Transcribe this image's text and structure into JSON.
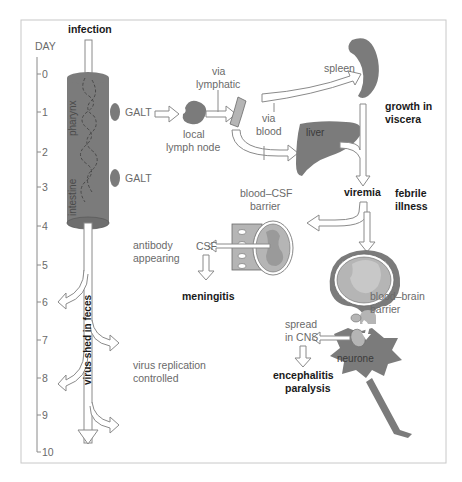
{
  "diagram": {
    "title": "infection",
    "day_axis": {
      "label": "DAY",
      "ticks": [
        "0",
        "1",
        "2",
        "3",
        "4",
        "5",
        "6",
        "7",
        "8",
        "9",
        "10"
      ]
    },
    "gut": {
      "upper_label": "pharynx",
      "lower_label": "intestine",
      "galt_upper": "GALT",
      "galt_lower": "GALT",
      "shed_label": "virus shed in feces"
    },
    "lymph": {
      "node_label_1": "local",
      "node_label_2": "lymph node",
      "via_lymphatic_1": "via",
      "via_lymphatic_2": "lymphatic",
      "via_blood_1": "via",
      "via_blood_2": "blood"
    },
    "viscera": {
      "spleen": "spleen",
      "liver": "liver",
      "growth_1": "growth in",
      "growth_2": "viscera"
    },
    "viremia": {
      "label": "viremia",
      "febrile_1": "febrile",
      "febrile_2": "illness"
    },
    "csf": {
      "barrier_1": "blood–CSF",
      "barrier_2": "barrier",
      "csf_label": "CSF",
      "outcome": "meningitis"
    },
    "brain": {
      "barrier_1": "blood–brain",
      "barrier_2": "barrier",
      "neurone": "neurone",
      "spread_1": "spread",
      "spread_2": "in CNS",
      "outcome_1": "encephalitis",
      "outcome_2": "paralysis"
    },
    "immune": {
      "antibody_1": "antibody",
      "antibody_2": "appearing",
      "controlled_1": "virus replication",
      "controlled_2": "controlled"
    },
    "colors": {
      "organ_fill": "#7b7b7b",
      "light_fill": "#b5b5b5",
      "arrow_stroke": "#8a8a8a",
      "label_text": "#6a6a6a",
      "bold_text": "#1a1a1a",
      "frame": "#c8c8c8"
    }
  }
}
